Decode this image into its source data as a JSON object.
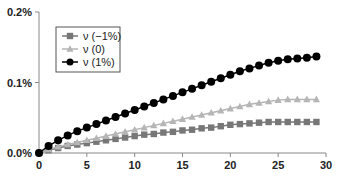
{
  "chart_data": {
    "type": "line",
    "title": "",
    "xlabel": "",
    "ylabel": "",
    "xlim": [
      0,
      30
    ],
    "ylim": [
      0,
      0.2
    ],
    "x_ticks": [
      "0",
      "5",
      "10",
      "15",
      "20",
      "25",
      "30"
    ],
    "y_ticks": [
      "0.0%",
      "0.1%",
      "0.2%"
    ],
    "legend_position": "top-left",
    "x": [
      0,
      1,
      2,
      3,
      4,
      5,
      6,
      7,
      8,
      9,
      10,
      11,
      12,
      13,
      14,
      15,
      16,
      17,
      18,
      19,
      20,
      21,
      22,
      23,
      24,
      25,
      26,
      27,
      28,
      29
    ],
    "series": [
      {
        "name": "ν (−1%)",
        "marker": "square",
        "color": "#777777",
        "values": [
          0,
          0.004,
          0.007,
          0.01,
          0.012,
          0.014,
          0.016,
          0.018,
          0.02,
          0.022,
          0.024,
          0.026,
          0.027,
          0.029,
          0.03,
          0.032,
          0.033,
          0.035,
          0.036,
          0.038,
          0.04,
          0.041,
          0.042,
          0.043,
          0.044,
          0.044,
          0.044,
          0.044,
          0.044,
          0.044
        ]
      },
      {
        "name": "ν (0)",
        "marker": "triangle",
        "color": "#b5b5b5",
        "values": [
          0,
          0.005,
          0.009,
          0.012,
          0.015,
          0.018,
          0.021,
          0.024,
          0.027,
          0.03,
          0.033,
          0.036,
          0.039,
          0.042,
          0.045,
          0.048,
          0.051,
          0.054,
          0.057,
          0.06,
          0.063,
          0.066,
          0.069,
          0.071,
          0.073,
          0.075,
          0.076,
          0.076,
          0.076,
          0.076
        ]
      },
      {
        "name": "ν (1%)",
        "marker": "circle",
        "color": "#000000",
        "values": [
          0,
          0.01,
          0.018,
          0.025,
          0.031,
          0.036,
          0.041,
          0.046,
          0.051,
          0.056,
          0.061,
          0.066,
          0.071,
          0.076,
          0.081,
          0.086,
          0.091,
          0.096,
          0.101,
          0.106,
          0.111,
          0.116,
          0.12,
          0.124,
          0.128,
          0.131,
          0.133,
          0.134,
          0.135,
          0.137
        ]
      }
    ]
  }
}
